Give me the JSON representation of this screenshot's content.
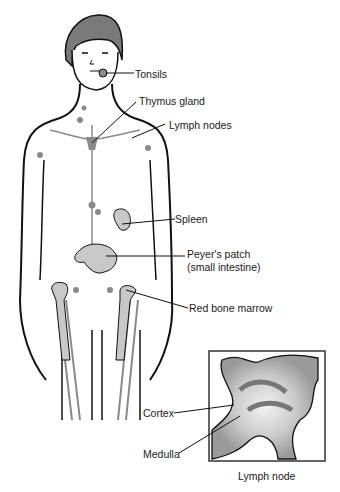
{
  "diagram": {
    "type": "anatomical illustration",
    "labels": {
      "tonsils": "Tonsils",
      "thymus": "Thymus gland",
      "lymph_nodes": "Lymph nodes",
      "spleen": "Spleen",
      "peyers_line1": "Peyer's patch",
      "peyers_line2": "(small intestine)",
      "marrow": "Red bone marrow",
      "cortex": "Cortex",
      "medulla": "Medulla",
      "inset_caption": "Lymph node"
    },
    "colors": {
      "outline": "#111111",
      "organ_fill": "#c8c8c8",
      "lymph_fill": "#8a8a8a",
      "hair": "#7a7a7a",
      "background": "#ffffff"
    }
  }
}
